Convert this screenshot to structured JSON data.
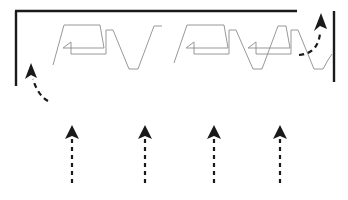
{
  "figure": {
    "title": "",
    "background_color": "#ffffff",
    "width": 348,
    "height": 200,
    "colors": {
      "boundary": "#1a1a1a",
      "path": "#8c8c8c",
      "arrow": "#1a1a1a"
    }
  },
  "boundary": {
    "name": "work-area-boundary",
    "segments": [
      {
        "id": "left-wall",
        "x1": 16,
        "y1": 11,
        "x2": 16,
        "y2": 86
      },
      {
        "id": "top-wall",
        "x1": 15,
        "y1": 11,
        "x2": 297,
        "y2": 11
      },
      {
        "id": "right-wall",
        "x1": 334,
        "y1": 11,
        "x2": 334,
        "y2": 82
      }
    ]
  },
  "coverage_paths": [
    {
      "id": "zigzag-group-left",
      "points": "53,65 64,25 100,25 104,48 63,48 71,42 71,54 106,54 106,30 113,30 129,69 138,69 154,26 162,26"
    },
    {
      "id": "zigzag-group-right",
      "points": "174,63 187,25 224,25 228,48 186,48 194,42 194,54 229,54 229,30 236,30 253,69 262,69 278,26 286,26 290,48 248,48 256,42 256,54 291,54 291,30 298,30 314,69 323,69"
    },
    {
      "id": "exit-tail",
      "points": "323,69 328,60 332,54"
    }
  ],
  "dashed_arrows": [
    {
      "id": "entry-arrow",
      "name": "entry-direction-arrow",
      "kind": "curved",
      "path": "M 38,95 C 35,88 33,84 32,78",
      "head": {
        "x": 31,
        "y": 63,
        "rotation": -10
      }
    },
    {
      "id": "exit-arrow",
      "name": "exit-direction-arrow",
      "kind": "curved",
      "path": "M 300,56 C 313,55 319,46 320,33",
      "head": {
        "x": 320,
        "y": 17,
        "rotation": 4
      }
    },
    {
      "id": "sweep-arrow-1",
      "name": "sweep-direction-arrow-1",
      "kind": "straight",
      "x": 72,
      "y_tail": 183,
      "y_head": 128
    },
    {
      "id": "sweep-arrow-2",
      "name": "sweep-direction-arrow-2",
      "kind": "straight",
      "x": 145,
      "y_tail": 183,
      "y_head": 128
    },
    {
      "id": "sweep-arrow-3",
      "name": "sweep-direction-arrow-3",
      "kind": "straight",
      "x": 214,
      "y_tail": 183,
      "y_head": 128
    },
    {
      "id": "sweep-arrow-4",
      "name": "sweep-direction-arrow-4",
      "kind": "straight",
      "x": 280,
      "y_tail": 183,
      "y_head": 128
    }
  ],
  "labels": []
}
